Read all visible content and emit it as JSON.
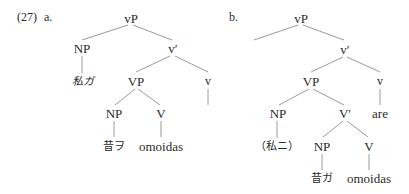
{
  "example_number": "(27)",
  "tree_a": {
    "label": "a.",
    "nodes": {
      "root": "vP",
      "spec": "NP",
      "spec_term": "私ガ",
      "vbar": "v′",
      "vp": "VP",
      "little_v": "v",
      "obj": "NP",
      "obj_term": "昔ヲ",
      "verb": "V",
      "verb_term": "omoidas"
    }
  },
  "tree_b": {
    "label": "b.",
    "nodes": {
      "root": "vP",
      "vbar": "v′",
      "vp": "VP",
      "little_v": "v",
      "little_v_term": "are",
      "spec": "NP",
      "spec_term": "（私ニ）",
      "Vbar": "V′",
      "obj": "NP",
      "obj_term": "昔ガ",
      "verb": "V",
      "verb_term": "omoidas"
    }
  },
  "colors": {
    "line": "#9a9a9a",
    "text": "#2a2a2a"
  }
}
